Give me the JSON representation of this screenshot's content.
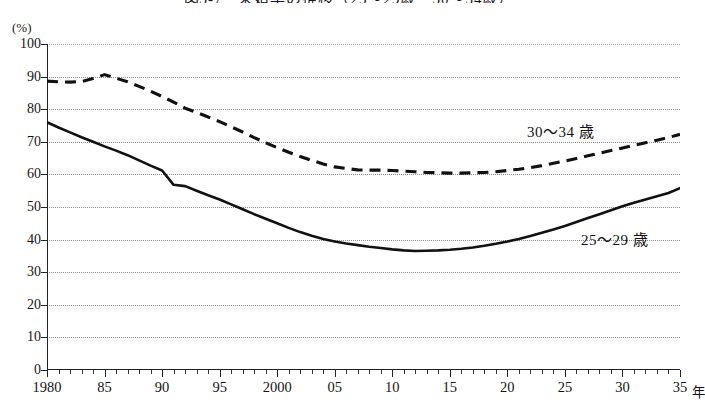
{
  "title": "図3-7　未婚率の推移（25〜29歳・30〜34歳）",
  "unit_label": "(%)",
  "x_axis_unit": "年",
  "series_labels": {
    "upper": "30〜34 歳",
    "lower": "25〜29 歳"
  },
  "chart_data": {
    "type": "line",
    "title": "図3-7　未婚率の推移（25〜29歳・30〜34歳）",
    "xlabel": "年",
    "ylabel": "(%)",
    "ylim": [
      0,
      100
    ],
    "xlim": [
      1980,
      2035
    ],
    "ytick_labels": [
      "0",
      "10",
      "20",
      "30",
      "40",
      "50",
      "60",
      "70",
      "80",
      "90",
      "100"
    ],
    "ytick_values": [
      0,
      10,
      20,
      30,
      40,
      50,
      60,
      70,
      80,
      90,
      100
    ],
    "xtick_labels": [
      "1980",
      "85",
      "90",
      "95",
      "2000",
      "05",
      "10",
      "15",
      "20",
      "25",
      "30",
      "35"
    ],
    "xtick_values": [
      1980,
      1985,
      1990,
      1995,
      2000,
      2005,
      2010,
      2015,
      2020,
      2025,
      2030,
      2035
    ],
    "x_minor_tick_interval": 1,
    "grid": "horizontal-dotted",
    "legend": "inline-annotation",
    "x": [
      1980,
      1981,
      1982,
      1983,
      1984,
      1985,
      1986,
      1987,
      1988,
      1989,
      1990,
      1991,
      1992,
      1993,
      1994,
      1995,
      1996,
      1997,
      1998,
      1999,
      2000,
      2001,
      2002,
      2003,
      2004,
      2005,
      2006,
      2007,
      2008,
      2009,
      2010,
      2011,
      2012,
      2013,
      2014,
      2015,
      2016,
      2017,
      2018,
      2019,
      2020,
      2021,
      2022,
      2023,
      2024,
      2025,
      2026,
      2027,
      2028,
      2029,
      2030,
      2031,
      2032,
      2033,
      2034,
      2035
    ],
    "series": [
      {
        "name": "25〜29 歳",
        "style": "solid",
        "color": "#111111",
        "values": [
          76.0,
          74.4,
          72.9,
          71.4,
          70.0,
          68.6,
          67.3,
          65.9,
          64.3,
          62.7,
          61.2,
          56.8,
          56.4,
          55.0,
          53.6,
          52.3,
          50.8,
          49.3,
          47.8,
          46.4,
          45.0,
          43.6,
          42.3,
          41.2,
          40.2,
          39.4,
          38.8,
          38.3,
          37.8,
          37.4,
          37.0,
          36.7,
          36.5,
          36.6,
          36.7,
          36.9,
          37.2,
          37.6,
          38.1,
          38.7,
          39.4,
          40.2,
          41.1,
          42.1,
          43.1,
          44.2,
          45.4,
          46.6,
          47.8,
          49.0,
          50.2,
          51.3,
          52.3,
          53.3,
          54.3,
          55.8
        ]
      },
      {
        "name": "30〜34 歳",
        "style": "dashed",
        "color": "#111111",
        "values": [
          88.6,
          88.4,
          88.3,
          88.5,
          89.4,
          90.6,
          89.5,
          88.4,
          87.0,
          85.5,
          83.9,
          82.2,
          80.3,
          79.0,
          77.6,
          76.2,
          74.6,
          73.0,
          71.3,
          69.7,
          68.2,
          66.8,
          65.5,
          64.3,
          63.2,
          62.3,
          61.8,
          61.4,
          61.3,
          61.3,
          61.2,
          61.0,
          60.8,
          60.6,
          60.5,
          60.4,
          60.4,
          60.5,
          60.6,
          60.8,
          61.2,
          61.6,
          62.1,
          62.7,
          63.4,
          64.1,
          64.9,
          65.7,
          66.5,
          67.3,
          68.1,
          68.9,
          69.7,
          70.5,
          71.3,
          72.3
        ]
      }
    ]
  }
}
